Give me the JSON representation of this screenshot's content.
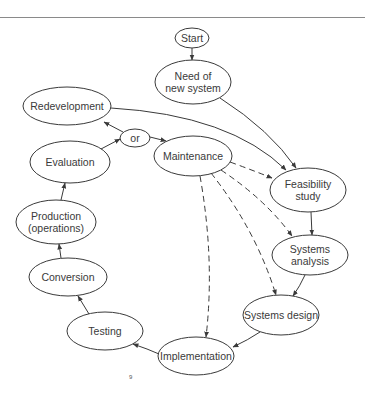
{
  "diagram": {
    "nodes": [
      {
        "id": "start",
        "lines": [
          "Start"
        ],
        "cx": 192,
        "cy": 38,
        "rx": 17,
        "ry": 10
      },
      {
        "id": "need",
        "lines": [
          "Need of",
          "new system"
        ],
        "cx": 193,
        "cy": 82,
        "rx": 38,
        "ry": 22
      },
      {
        "id": "redevelopment",
        "lines": [
          "Redevelopment"
        ],
        "cx": 67,
        "cy": 106,
        "rx": 44,
        "ry": 19
      },
      {
        "id": "or",
        "lines": [
          "or"
        ],
        "cx": 135,
        "cy": 138,
        "rx": 15,
        "ry": 9
      },
      {
        "id": "maintenance",
        "lines": [
          "Maintenance"
        ],
        "cx": 193,
        "cy": 156,
        "rx": 39,
        "ry": 20
      },
      {
        "id": "feasibility",
        "lines": [
          "Feasibility",
          "study"
        ],
        "cx": 308,
        "cy": 190,
        "rx": 38,
        "ry": 22
      },
      {
        "id": "analysis",
        "lines": [
          "Systems",
          "analysis"
        ],
        "cx": 310,
        "cy": 255,
        "rx": 38,
        "ry": 20
      },
      {
        "id": "design",
        "lines": [
          "Systems design"
        ],
        "cx": 281,
        "cy": 315,
        "rx": 38,
        "ry": 20
      },
      {
        "id": "implementation",
        "lines": [
          "Implementation"
        ],
        "cx": 196,
        "cy": 356,
        "rx": 38,
        "ry": 19
      },
      {
        "id": "testing",
        "lines": [
          "Testing"
        ],
        "cx": 105,
        "cy": 331,
        "rx": 38,
        "ry": 19
      },
      {
        "id": "conversion",
        "lines": [
          "Conversion"
        ],
        "cx": 68,
        "cy": 277,
        "rx": 39,
        "ry": 19
      },
      {
        "id": "production",
        "lines": [
          "Production",
          "(operations)"
        ],
        "cx": 56,
        "cy": 222,
        "rx": 40,
        "ry": 22
      },
      {
        "id": "evaluation",
        "lines": [
          "Evaluation"
        ],
        "cx": 70,
        "cy": 162,
        "rx": 40,
        "ry": 21
      }
    ],
    "edges": [
      {
        "from": "start",
        "to": "need",
        "style": "solid",
        "d": "M192 48 L192 60"
      },
      {
        "from": "need",
        "to": "feasibility",
        "style": "solid",
        "d": "M220 98 Q270 130 296 168"
      },
      {
        "from": "redevelopment",
        "to": "feasibility",
        "style": "solid",
        "d": "M111 108 Q230 115 286 170"
      },
      {
        "from": "or",
        "to": "redevelopment",
        "style": "solid",
        "d": "M123 132 L104 122"
      },
      {
        "from": "or",
        "to": "maintenance",
        "style": "solid",
        "d": "M150 137 L166 141"
      },
      {
        "from": "evaluation",
        "to": "or",
        "style": "solid",
        "d": "M101 149 L120 139"
      },
      {
        "from": "maintenance",
        "to": "feasibility",
        "style": "dashed",
        "d": "M230 162 Q252 170 272 178"
      },
      {
        "from": "maintenance",
        "to": "analysis",
        "style": "dashed",
        "d": "M221 170 Q266 200 292 236"
      },
      {
        "from": "maintenance",
        "to": "design",
        "style": "dashed",
        "d": "M211 173 Q256 230 276 295"
      },
      {
        "from": "maintenance",
        "to": "implementation",
        "style": "dashed",
        "d": "M200 176 Q215 260 206 337"
      },
      {
        "from": "feasibility",
        "to": "analysis",
        "style": "solid",
        "d": "M311 212 L312 235"
      },
      {
        "from": "analysis",
        "to": "design",
        "style": "solid",
        "d": "M305 275 Q300 286 293 296"
      },
      {
        "from": "design",
        "to": "implementation",
        "style": "solid",
        "d": "M260 332 Q248 340 233 347"
      },
      {
        "from": "implementation",
        "to": "testing",
        "style": "solid",
        "d": "M159 354 Q148 349 133 344"
      },
      {
        "from": "testing",
        "to": "conversion",
        "style": "solid",
        "d": "M89 314 L78 296"
      },
      {
        "from": "conversion",
        "to": "production",
        "style": "solid",
        "d": "M61 258 L59 244"
      },
      {
        "from": "production",
        "to": "evaluation",
        "style": "solid",
        "d": "M61 200 L65 183"
      }
    ],
    "page_number": "9"
  }
}
